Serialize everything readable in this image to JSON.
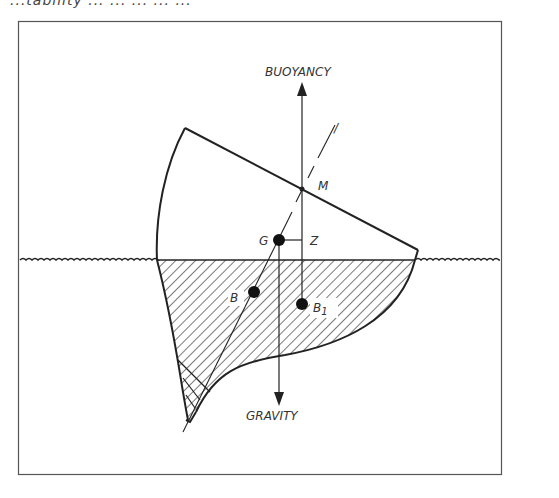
{
  "caption_fragment": "...tability ... ... ... ... ...",
  "diagram": {
    "labels": {
      "buoyancy": "BUOYANCY",
      "gravity": "GRAVITY",
      "metacenter": "M",
      "center_of_gravity": "G",
      "z_point": "Z",
      "center_of_buoyancy": "B",
      "shifted_center_of_buoyancy_main": "B",
      "shifted_center_of_buoyancy_sub": "1",
      "centerline_mark": "/"
    },
    "colors": {
      "ink": "#222222",
      "frame": "#555555",
      "background": "#ffffff"
    }
  }
}
